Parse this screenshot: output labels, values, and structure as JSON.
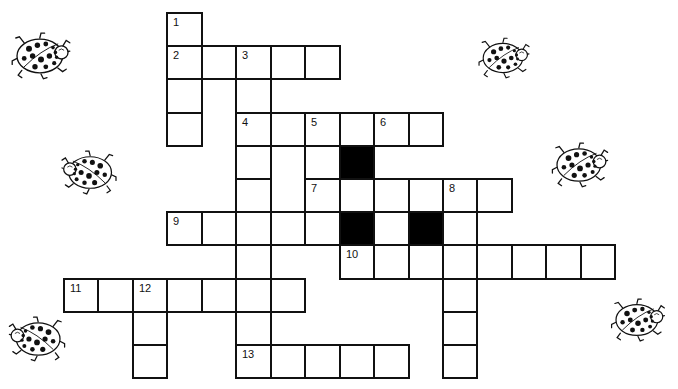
{
  "puzzle": {
    "type": "crossword",
    "theme_decoration": "ladybug",
    "grid": {
      "origin_x": 63,
      "origin_y": 12,
      "cell_w": 34.45,
      "cell_h": 33.2,
      "line_color": "#111111",
      "black_color": "#000000"
    },
    "clue_numbers": [
      {
        "n": "1",
        "row": 0,
        "col": 3
      },
      {
        "n": "2",
        "row": 1,
        "col": 3
      },
      {
        "n": "3",
        "row": 1,
        "col": 5
      },
      {
        "n": "4",
        "row": 3,
        "col": 5
      },
      {
        "n": "5",
        "row": 3,
        "col": 7
      },
      {
        "n": "6",
        "row": 3,
        "col": 9
      },
      {
        "n": "7",
        "row": 5,
        "col": 7
      },
      {
        "n": "8",
        "row": 5,
        "col": 11
      },
      {
        "n": "9",
        "row": 6,
        "col": 3
      },
      {
        "n": "10",
        "row": 7,
        "col": 8
      },
      {
        "n": "11",
        "row": 8,
        "col": 0
      },
      {
        "n": "12",
        "row": 8,
        "col": 2
      },
      {
        "n": "13",
        "row": 10,
        "col": 5
      }
    ],
    "entries": [
      {
        "label": "1 Down",
        "row": 0,
        "col": 3,
        "dir": "down",
        "len": 4
      },
      {
        "label": "2 Across",
        "row": 1,
        "col": 3,
        "dir": "across",
        "len": 5
      },
      {
        "label": "3 Down",
        "row": 1,
        "col": 5,
        "dir": "down",
        "len": 10
      },
      {
        "label": "4 Across",
        "row": 3,
        "col": 5,
        "dir": "across",
        "len": 6
      },
      {
        "label": "5 Down",
        "row": 3,
        "col": 7,
        "dir": "down",
        "len": 4
      },
      {
        "label": "6 Down",
        "row": 3,
        "col": 9,
        "dir": "down",
        "len": 1
      },
      {
        "label": "7 Across",
        "row": 5,
        "col": 7,
        "dir": "across",
        "len": 6
      },
      {
        "label": "8 Down",
        "row": 5,
        "col": 11,
        "dir": "down",
        "len": 6
      },
      {
        "label": "9 Across",
        "row": 6,
        "col": 3,
        "dir": "across",
        "len": 9
      },
      {
        "label": "10 Across",
        "row": 7,
        "col": 8,
        "dir": "across",
        "len": 8
      },
      {
        "label": "11 Across",
        "row": 8,
        "col": 0,
        "dir": "across",
        "len": 7
      },
      {
        "label": "12 Down",
        "row": 8,
        "col": 2,
        "dir": "down",
        "len": 3
      },
      {
        "label": "13 Across",
        "row": 10,
        "col": 5,
        "dir": "across",
        "len": 5
      }
    ],
    "black_cells": [
      {
        "row": 4,
        "col": 8
      },
      {
        "row": 6,
        "col": 8
      },
      {
        "row": 6,
        "col": 10
      }
    ],
    "ladybugs": [
      {
        "name": "ladybug-top-left",
        "x": 10,
        "y": 32,
        "w": 62,
        "h": 48,
        "flip": false
      },
      {
        "name": "ladybug-top-right",
        "x": 478,
        "y": 33,
        "w": 52,
        "h": 50,
        "flip": false
      },
      {
        "name": "ladybug-mid-left",
        "x": 60,
        "y": 150,
        "w": 58,
        "h": 45,
        "flip": true
      },
      {
        "name": "ladybug-mid-right",
        "x": 551,
        "y": 142,
        "w": 58,
        "h": 46,
        "flip": false
      },
      {
        "name": "ladybug-bottom-left",
        "x": 8,
        "y": 316,
        "w": 58,
        "h": 46,
        "flip": true
      },
      {
        "name": "ladybug-bottom-right",
        "x": 608,
        "y": 298,
        "w": 60,
        "h": 44,
        "flip": false
      }
    ]
  }
}
